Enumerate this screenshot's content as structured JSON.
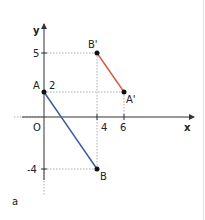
{
  "diagram": {
    "label": "a",
    "axes": {
      "x_label": "x",
      "y_label": "y",
      "origin_label": "O"
    },
    "ticks": {
      "x": [
        {
          "value": 4,
          "label": "4"
        },
        {
          "value": 6,
          "label": "6"
        }
      ],
      "y": [
        {
          "value": 5,
          "label": "5"
        },
        {
          "value": 2,
          "label": "2"
        },
        {
          "value": -4,
          "label": "-4"
        }
      ]
    },
    "points": {
      "A": {
        "label": "A",
        "x": 0,
        "y": 2
      },
      "B": {
        "label": "B",
        "x": 4,
        "y": -4
      },
      "A_prime": {
        "label": "A'",
        "x": 6,
        "y": 2
      },
      "B_prime": {
        "label": "B'",
        "x": 4,
        "y": 5
      }
    },
    "segments": [
      {
        "from": "A",
        "to": "B",
        "color": "#3a5a9a"
      },
      {
        "from": "B'",
        "to": "A'",
        "color": "#e0533a"
      }
    ]
  }
}
